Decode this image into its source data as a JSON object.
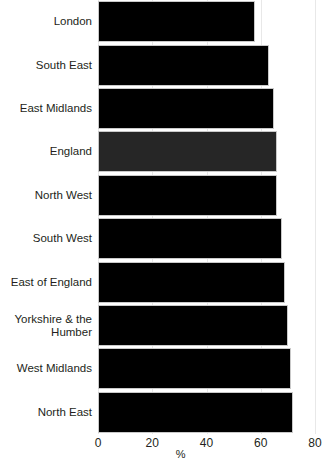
{
  "chart_data": {
    "type": "bar",
    "orientation": "horizontal",
    "title": "",
    "xlabel": "%",
    "ylabel": "",
    "xlim": [
      0,
      80
    ],
    "xticks": [
      0,
      20,
      40,
      60,
      80
    ],
    "xtick_labels": [
      "0",
      "20",
      "40",
      "60",
      "80"
    ],
    "grid": true,
    "grid_axis": "x",
    "legend": false,
    "categories": [
      "London",
      "South East",
      "East Midlands",
      "England",
      "North West",
      "South West",
      "East of England",
      "Yorkshire & the\nHumber",
      "West Midlands",
      "North East"
    ],
    "values": [
      58,
      63,
      65,
      66,
      66,
      68,
      69,
      70,
      71,
      72
    ],
    "bar_colors": [
      "#000000",
      "#000000",
      "#000000",
      "#262626",
      "#000000",
      "#000000",
      "#000000",
      "#000000",
      "#000000",
      "#000000"
    ],
    "highlight_category": "England",
    "bar_edge_color": "#c9c9c9",
    "grid_color": "#e8e8e8",
    "text_color": "#231f20",
    "background_color": "#ffffff"
  }
}
